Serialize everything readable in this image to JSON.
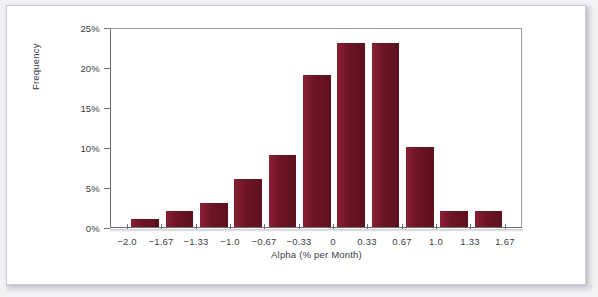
{
  "chart_data": {
    "type": "bar",
    "title": "",
    "subtitle": "",
    "xlabel": "Alpha (% per Month)",
    "ylabel": "Frequency",
    "grid": false,
    "legend": null,
    "xlim": [
      -2.165,
      1.835
    ],
    "ylim": [
      0,
      25
    ],
    "ytick_labels": [
      "0%",
      "5%",
      "10%",
      "15%",
      "20%",
      "25%"
    ],
    "ytick_values": [
      0,
      5,
      10,
      15,
      20,
      25
    ],
    "xtick_labels": [
      "-2.0",
      "-1.67",
      "-1.33",
      "-1.0",
      "-0.67",
      "-0.33",
      "0",
      "0.33",
      "0.67",
      "1.0",
      "1.33",
      "1.67"
    ],
    "xtick_values": [
      -2.0,
      -1.67,
      -1.33,
      -1.0,
      -0.67,
      -0.33,
      0,
      0.33,
      0.67,
      1.0,
      1.33,
      1.67
    ],
    "bar_color": "#73182a",
    "bin_width": 0.335,
    "categories": [
      "-2.0 to -1.67",
      "-1.67 to -1.33",
      "-1.33 to -1.0",
      "-1.0 to -0.67",
      "-0.67 to -0.33",
      "-0.33 to 0",
      "0 to 0.33",
      "0.33 to 0.67",
      "0.67 to 1.0",
      "1.0 to 1.33",
      "1.33 to 1.67"
    ],
    "bars": [
      {
        "label": "-2.0 to -1.67",
        "center": -1.835,
        "value": 1
      },
      {
        "label": "-1.67 to -1.33",
        "center": -1.5,
        "value": 2
      },
      {
        "label": "-1.33 to -1.0",
        "center": -1.165,
        "value": 3
      },
      {
        "label": "-1.0 to -0.67",
        "center": -0.835,
        "value": 6
      },
      {
        "label": "-0.67 to -0.33",
        "center": -0.5,
        "value": 9
      },
      {
        "label": "-0.33 to 0",
        "center": -0.165,
        "value": 19
      },
      {
        "label": "0 to 0.33",
        "center": 0.165,
        "value": 23
      },
      {
        "label": "0.33 to 0.67",
        "center": 0.5,
        "value": 23
      },
      {
        "label": "0.67 to 1.0",
        "center": 0.835,
        "value": 10
      },
      {
        "label": "1.0 to 1.33",
        "center": 1.165,
        "value": 2
      },
      {
        "label": "1.33 to 1.67",
        "center": 1.5,
        "value": 2
      }
    ],
    "values": [
      1,
      2,
      3,
      6,
      9,
      19,
      23,
      23,
      10,
      2,
      2
    ]
  }
}
